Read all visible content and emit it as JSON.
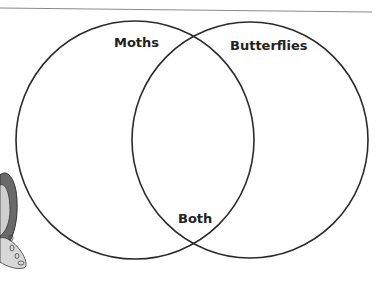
{
  "diagram": {
    "type": "venn",
    "sets": [
      {
        "label": "Moths"
      },
      {
        "label": "Butterflies"
      }
    ],
    "intersection_label": "Both",
    "colors": {
      "stroke": "#2a2a2a",
      "rule": "#8a8a8a",
      "clipart_dark": "#555555",
      "clipart_light": "#cfcfcf"
    }
  }
}
